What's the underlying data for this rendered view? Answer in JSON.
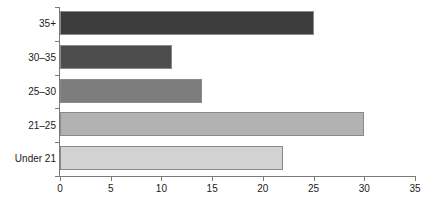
{
  "chart_data": {
    "type": "bar",
    "orientation": "horizontal",
    "title": "",
    "subtitle": "",
    "xlabel": "",
    "ylabel": "",
    "categories": [
      "Under 21",
      "21–25",
      "25–30",
      "30–35",
      "35+"
    ],
    "values": [
      22,
      30,
      14,
      11,
      25
    ],
    "bars": [
      {
        "category": "35+",
        "value": 25,
        "color": "#3d3d3d"
      },
      {
        "category": "30–35",
        "value": 11,
        "color": "#4d4d4d"
      },
      {
        "category": "25–30",
        "value": 14,
        "color": "#7d7d7d"
      },
      {
        "category": "21–25",
        "value": 30,
        "color": "#b2b2b2"
      },
      {
        "category": "Under 21",
        "value": 22,
        "color": "#d2d2d2"
      }
    ],
    "xlim": [
      0,
      35
    ],
    "xticks": [
      0,
      5,
      10,
      15,
      20,
      25,
      30,
      35
    ],
    "xtick_labels": [
      "0",
      "5",
      "10",
      "15",
      "20",
      "25",
      "30",
      "35"
    ],
    "grid": false,
    "legend": "none",
    "axis_color": "#7a7a7a",
    "bar_border_color": "#8a8a8a",
    "background": "#ffffff"
  }
}
